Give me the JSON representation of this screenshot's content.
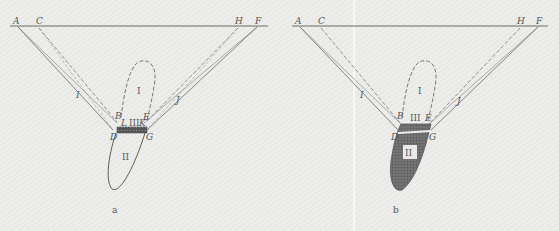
{
  "figure": {
    "panels": [
      {
        "id": "a",
        "caption": "a",
        "points": {
          "A": "A",
          "C": "C",
          "H": "H",
          "F": "F",
          "I": "I",
          "J": "J",
          "B": "B",
          "E": "E",
          "L": "L",
          "K": "K",
          "D": "D",
          "G": "G"
        },
        "regions": {
          "r1": "I",
          "r2": "II",
          "r3": "III"
        }
      },
      {
        "id": "b",
        "caption": "b",
        "points": {
          "A": "A",
          "C": "C",
          "H": "H",
          "F": "F",
          "I": "I",
          "J": "J",
          "B": "B",
          "E": "E",
          "D": "D",
          "G": "G"
        },
        "regions": {
          "r1": "I",
          "r2": "II",
          "r3": "III"
        }
      }
    ],
    "colors": {
      "line": "#6a6a6a",
      "fill_dark": "#5e5e5e",
      "background": "#e9e9e7"
    }
  }
}
